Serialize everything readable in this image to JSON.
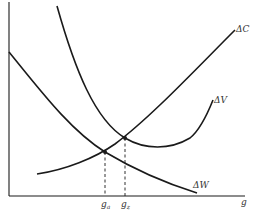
{
  "diagram": {
    "type": "economic-curves",
    "axes": {
      "x_label": "g",
      "y_label": ""
    },
    "curves": [
      {
        "id": "dC",
        "label": "ΔC",
        "description": "Rising convex curve"
      },
      {
        "id": "dV",
        "label": "ΔV",
        "description": "U-shaped curve"
      },
      {
        "id": "dW",
        "label": "ΔW",
        "description": "Declining convex curve"
      }
    ],
    "points": [
      {
        "id": "ga",
        "label_base": "g",
        "label_sub": "a",
        "description": "Intersection of ΔW and ΔC"
      },
      {
        "id": "gz",
        "label_base": "g",
        "label_sub": "z",
        "description": "Intersection of ΔV and ΔC"
      }
    ],
    "colors": {
      "line": "#1a1a1a",
      "background": "#ffffff"
    }
  }
}
